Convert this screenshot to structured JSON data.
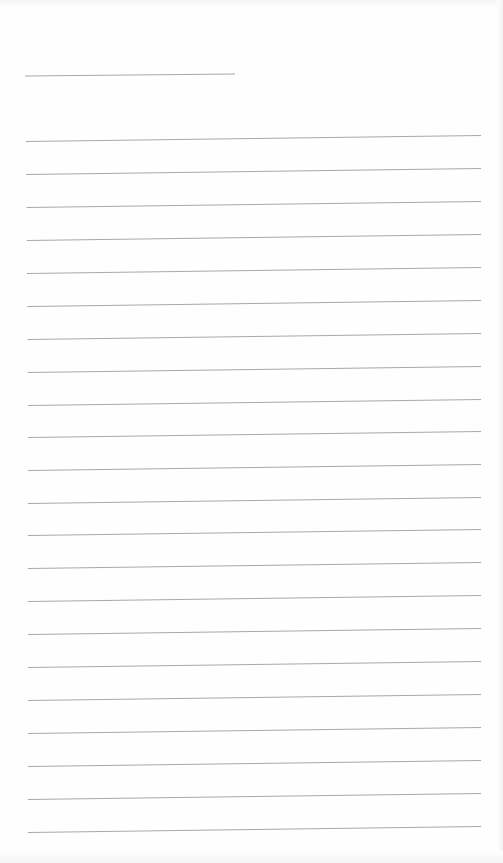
{
  "document": {
    "type": "blank lined paper",
    "background_color": "#fefefe",
    "line_color": "#a8a8a8",
    "header_line": {
      "x1": 25,
      "y1": 76,
      "x2": 235,
      "y2": 74
    },
    "rule_lines": {
      "x_start": 26,
      "x_end": 481,
      "slant_px": 6,
      "left_y": [
        141,
        174,
        207,
        240,
        273,
        306,
        339,
        372,
        405,
        437,
        470,
        503,
        535,
        568,
        601,
        634,
        667,
        700,
        733,
        766,
        799,
        832
      ]
    }
  }
}
